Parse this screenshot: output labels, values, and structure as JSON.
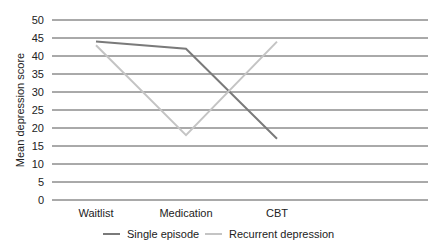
{
  "chart_data": {
    "type": "line",
    "title": "",
    "xlabel": "",
    "ylabel": "Mean depression score",
    "categories": [
      "Waitlist",
      "Medication",
      "CBT"
    ],
    "series": [
      {
        "name": "Single episode",
        "color": "#7a7a7a",
        "values": [
          44,
          42,
          17
        ]
      },
      {
        "name": "Recurrent depression",
        "color": "#c4c4c4",
        "values": [
          43,
          18,
          44
        ]
      }
    ],
    "ylim": [
      0,
      50
    ],
    "yticks": [
      0,
      5,
      10,
      15,
      20,
      25,
      30,
      35,
      40,
      45,
      50
    ],
    "grid": true,
    "legend_position": "bottom"
  }
}
